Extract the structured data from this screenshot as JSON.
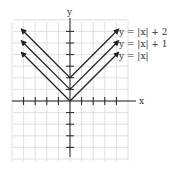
{
  "chart_data": {
    "type": "line",
    "title": "",
    "xlabel": "x",
    "ylabel": "y",
    "xlim": [
      -5,
      5
    ],
    "ylim": [
      -4,
      7
    ],
    "grid": true,
    "series": [
      {
        "name": "y = |x| + 2",
        "x": [
          -4,
          0,
          4
        ],
        "y": [
          6,
          2,
          6
        ]
      },
      {
        "name": "y = |x| + 1",
        "x": [
          -4,
          0,
          4
        ],
        "y": [
          5,
          1,
          5
        ]
      },
      {
        "name": "y = |x|",
        "x": [
          -4,
          0,
          4
        ],
        "y": [
          4,
          0,
          4
        ]
      }
    ],
    "legend": [
      "y = |x| + 2",
      "y = |x| + 1",
      "y = |x|"
    ],
    "legend_position": "upper right (inline labels)"
  },
  "labels": {
    "x_axis": "x",
    "y_axis": "y",
    "curve1": "y = |x| + 2",
    "curve2": "y = |x| + 1",
    "curve3": "y = |x|"
  }
}
